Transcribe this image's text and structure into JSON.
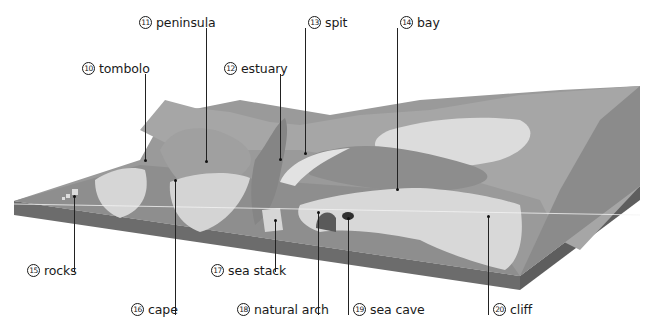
{
  "diagram": {
    "type": "coastal landforms block diagram",
    "colors": {
      "sea_deep": "#8a8a8a",
      "sea_mid": "#9d9d9d",
      "sea_shallow": "#b2b2b2",
      "land": "#a9a9a9",
      "land_dark": "#8f8f8f",
      "cliff_face": "#d6d6d6",
      "beach": "#e4e4e4",
      "block_side": "#6c6c6c",
      "cave": "#2f2f2f",
      "leader": "#222222"
    },
    "labels": [
      {
        "id": "10",
        "num": "10",
        "text": "tombolo"
      },
      {
        "id": "11",
        "num": "11",
        "text": "peninsula"
      },
      {
        "id": "12",
        "num": "12",
        "text": "estuary"
      },
      {
        "id": "13",
        "num": "13",
        "text": "spit"
      },
      {
        "id": "14",
        "num": "14",
        "text": "bay"
      },
      {
        "id": "15",
        "num": "15",
        "text": "rocks"
      },
      {
        "id": "16",
        "num": "16",
        "text": "cape"
      },
      {
        "id": "17",
        "num": "17",
        "text": "sea stack"
      },
      {
        "id": "18",
        "num": "18",
        "text": "natural arch"
      },
      {
        "id": "19",
        "num": "19",
        "text": "sea cave"
      },
      {
        "id": "20",
        "num": "20",
        "text": "cliff"
      }
    ]
  }
}
